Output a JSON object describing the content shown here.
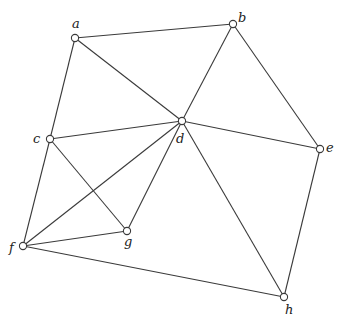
{
  "diagram": {
    "type": "undirected-graph",
    "colors": {
      "edge": "#3a3a3a",
      "node_fill": "#ffffff",
      "label": "#222222"
    },
    "nodes": [
      {
        "id": "a",
        "label": "a",
        "x": 75,
        "y": 38,
        "lx": 72,
        "ly": 28
      },
      {
        "id": "b",
        "label": "b",
        "x": 233,
        "y": 24,
        "lx": 238,
        "ly": 22
      },
      {
        "id": "c",
        "label": "c",
        "x": 50,
        "y": 139,
        "lx": 33,
        "ly": 143
      },
      {
        "id": "d",
        "label": "d",
        "x": 182,
        "y": 121,
        "lx": 176,
        "ly": 143
      },
      {
        "id": "e",
        "label": "e",
        "x": 320,
        "y": 149,
        "lx": 326,
        "ly": 152
      },
      {
        "id": "f",
        "label": "f",
        "x": 23,
        "y": 246,
        "lx": 9,
        "ly": 252
      },
      {
        "id": "g",
        "label": "g",
        "x": 127,
        "y": 231,
        "lx": 124,
        "ly": 246
      },
      {
        "id": "h",
        "label": "h",
        "x": 284,
        "y": 297,
        "lx": 285,
        "ly": 314
      }
    ],
    "edges": [
      [
        "a",
        "b"
      ],
      [
        "a",
        "c"
      ],
      [
        "a",
        "d"
      ],
      [
        "b",
        "d"
      ],
      [
        "b",
        "e"
      ],
      [
        "c",
        "d"
      ],
      [
        "c",
        "g"
      ],
      [
        "c",
        "f"
      ],
      [
        "d",
        "e"
      ],
      [
        "d",
        "f"
      ],
      [
        "d",
        "g"
      ],
      [
        "d",
        "h"
      ],
      [
        "e",
        "h"
      ],
      [
        "f",
        "g"
      ],
      [
        "f",
        "h"
      ]
    ]
  }
}
